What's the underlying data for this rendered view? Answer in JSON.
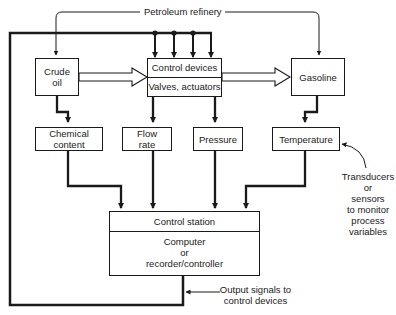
{
  "diagram": {
    "top_label": "Petroleum refinery",
    "nodes": {
      "crude_oil": [
        "Crude",
        "oil"
      ],
      "control_devices": {
        "title": "Control devices",
        "subtitle": "Valves, actuators"
      },
      "gasoline": "Gasoline",
      "chemical_content": [
        "Chemical",
        "content"
      ],
      "flow_rate": [
        "Flow",
        "rate"
      ],
      "pressure": "Pressure",
      "temperature": "Temperature",
      "control_station": {
        "title": "Control station",
        "body": [
          "Computer",
          "or",
          "recorder/controller"
        ]
      }
    },
    "annotations": {
      "transducers": [
        "Transducers",
        "or",
        "sensors",
        "to monitor",
        "process",
        "variables"
      ],
      "output_signals": [
        "Output signals to",
        "control devices"
      ]
    },
    "stroke_color": "#1a1a1a"
  }
}
